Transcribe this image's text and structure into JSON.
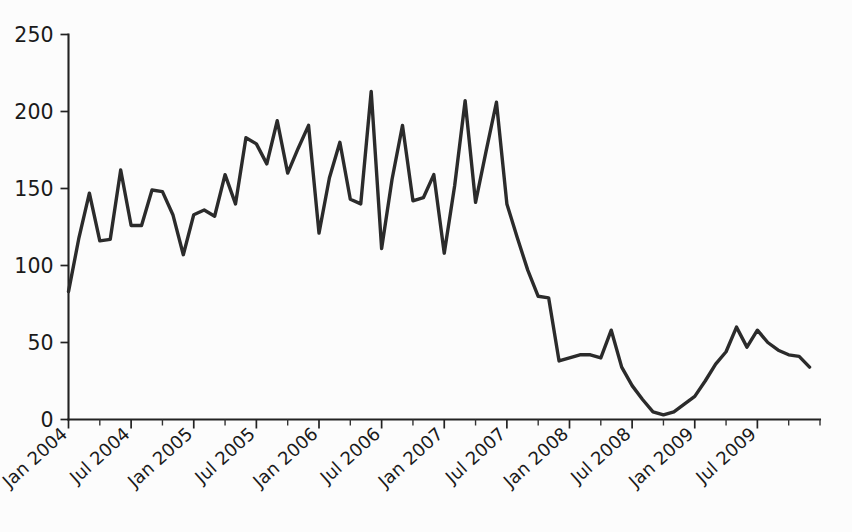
{
  "page": {
    "background_color": "#fcfcfc",
    "width": 852,
    "height": 532
  },
  "chart_data": {
    "type": "line",
    "title": "",
    "subtitle": "",
    "xlabel": "",
    "ylabel": "",
    "ylim": [
      0,
      250
    ],
    "y_ticks": [
      0,
      50,
      100,
      150,
      200,
      250
    ],
    "y_tick_labels": [
      "0",
      "50",
      "100",
      "150",
      "200",
      "250"
    ],
    "grid": false,
    "legend": false,
    "legend_position": "none",
    "line_color": "#2b2b2b",
    "axis_color": "#222222",
    "x_tick_labels": [
      "Jan 2004",
      "Jul 2004",
      "Jan 2005",
      "Jul 2005",
      "Jan 2006",
      "Jul 2006",
      "Jan 2007",
      "Jul 2007",
      "Jan 2008",
      "Jul 2008",
      "Jan 2009",
      "Jul 2009"
    ],
    "x_tick_months": [
      0,
      6,
      12,
      18,
      24,
      30,
      36,
      42,
      48,
      54,
      60,
      66
    ],
    "x_minor_tick_interval_months": 3,
    "x_range_months": [
      0,
      72
    ],
    "x_start": "Jan 2004",
    "x_end": "Dec 2009",
    "series": [
      {
        "name": "value",
        "x": [
          "Jan 2004",
          "Feb 2004",
          "Mar 2004",
          "Apr 2004",
          "May 2004",
          "Jun 2004",
          "Jul 2004",
          "Aug 2004",
          "Sep 2004",
          "Oct 2004",
          "Nov 2004",
          "Dec 2004",
          "Jan 2005",
          "Feb 2005",
          "Mar 2005",
          "Apr 2005",
          "May 2005",
          "Jun 2005",
          "Jul 2005",
          "Aug 2005",
          "Sep 2005",
          "Oct 2005",
          "Nov 2005",
          "Dec 2005",
          "Jan 2006",
          "Feb 2006",
          "Mar 2006",
          "Apr 2006",
          "May 2006",
          "Jun 2006",
          "Jul 2006",
          "Aug 2006",
          "Sep 2006",
          "Oct 2006",
          "Nov 2006",
          "Dec 2006",
          "Jan 2007",
          "Feb 2007",
          "Mar 2007",
          "Apr 2007",
          "May 2007",
          "Jun 2007",
          "Jul 2007",
          "Aug 2007",
          "Sep 2007",
          "Oct 2007",
          "Nov 2007",
          "Dec 2007",
          "Jan 2008",
          "Feb 2008",
          "Mar 2008",
          "Apr 2008",
          "May 2008",
          "Jun 2008",
          "Jul 2008",
          "Aug 2008",
          "Sep 2008",
          "Oct 2008",
          "Nov 2008",
          "Dec 2008",
          "Jan 2009",
          "Feb 2009",
          "Mar 2009",
          "Apr 2009",
          "May 2009",
          "Jun 2009",
          "Jul 2009",
          "Aug 2009",
          "Sep 2009",
          "Oct 2009",
          "Nov 2009",
          "Dec 2009"
        ],
        "values": [
          83,
          118,
          147,
          116,
          117,
          162,
          126,
          126,
          149,
          148,
          133,
          107,
          133,
          136,
          132,
          159,
          140,
          183,
          179,
          166,
          194,
          160,
          176,
          191,
          121,
          157,
          180,
          143,
          140,
          213,
          111,
          156,
          191,
          142,
          144,
          159,
          108,
          152,
          207,
          141,
          174,
          206,
          140,
          118,
          97,
          80,
          79,
          38,
          40,
          42,
          42,
          40,
          58,
          34,
          22,
          13,
          5,
          3,
          5,
          10,
          15,
          25,
          36,
          44,
          60,
          47,
          58,
          50,
          45,
          42,
          41,
          34
        ],
        "min": 3,
        "max": 213
      }
    ]
  }
}
